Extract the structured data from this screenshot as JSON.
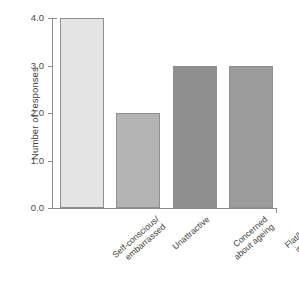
{
  "chart_data": {
    "type": "bar",
    "title": "",
    "xlabel": "",
    "ylabel": "Number of responses",
    "ylim": [
      0,
      4
    ],
    "grid": false,
    "legend": "none",
    "categories": [
      "Self-conscious/ embarrassed",
      "Unattractive",
      "Concerned about ageing",
      "Flat/lacking in fullness"
    ],
    "category_lines": [
      [
        "Self-conscious/",
        "embarrassed"
      ],
      [
        "Unattractive"
      ],
      [
        "Concerned",
        "about ageing"
      ],
      [
        "Flat/lacking",
        "in fullness"
      ]
    ],
    "values": [
      4,
      2,
      3,
      3
    ],
    "ytick_labels": [
      "0.0",
      "1.0",
      "2.0",
      "3.0",
      "4.0"
    ],
    "ytick_values": [
      0,
      1,
      2,
      3,
      4
    ],
    "bar_colors": [
      "#e4e4e4",
      "#b4b4b4",
      "#8f8f8f",
      "#9b9b9b"
    ],
    "bar_edge_color": "#8f8f8f",
    "axis_color": "#8c8c8c",
    "background_color": "#ffffff",
    "text_color": "#3d3d3d"
  }
}
